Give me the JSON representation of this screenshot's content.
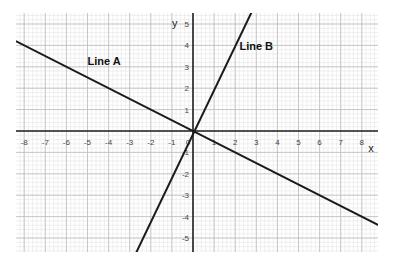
{
  "chart_data": {
    "type": "line",
    "title": "",
    "xlabel": "x",
    "ylabel": "y",
    "xlim": [
      -8.4,
      8.8
    ],
    "ylim": [
      -5.7,
      5.6
    ],
    "grid": true,
    "grid_major_step": 1,
    "grid_minor_step": 0.2,
    "x_ticks": [
      -8,
      -7,
      -6,
      -5,
      -4,
      -3,
      -2,
      -1,
      0,
      1,
      2,
      3,
      4,
      5,
      6,
      7,
      8
    ],
    "y_ticks": [
      -5,
      -4,
      -3,
      -2,
      -1,
      1,
      2,
      3,
      4,
      5
    ],
    "series": [
      {
        "name": "Line A",
        "equation": "y = -0.5x",
        "slope": -0.5,
        "intercept": 0,
        "x": [
          -8.4,
          8.8
        ],
        "y": [
          4.2,
          -4.4
        ],
        "color": "#1a1a1a",
        "label_position": [
          -5,
          3.1
        ]
      },
      {
        "name": "Line B",
        "equation": "y = 2x",
        "slope": 2,
        "intercept": 0,
        "x": [
          -2.7,
          2.8
        ],
        "y": [
          -5.7,
          5.6
        ],
        "color": "#1a1a1a",
        "label_position": [
          2.2,
          3.8
        ]
      }
    ],
    "legend": "none (inline labels)"
  },
  "labels": {
    "x_axis": "x",
    "y_axis": "y",
    "line_a": "Line A",
    "line_b": "Line B"
  }
}
